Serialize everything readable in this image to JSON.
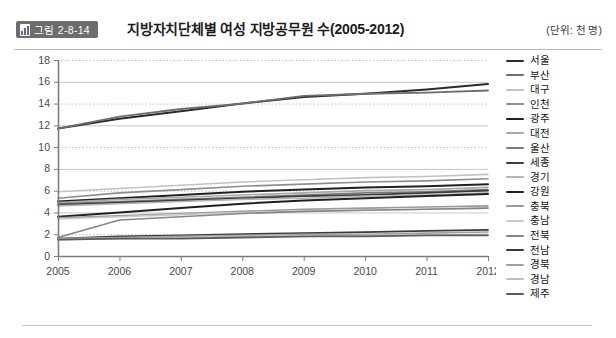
{
  "header": {
    "badge_label": "그림 2-8-14",
    "badge_icon": "bar-chart-icon",
    "title": "지방자치단체별 여성 지방공무원 수(2005-2012)",
    "unit_note": "(단위: 천 명)"
  },
  "colors": {
    "badge_bg": "#6d6d6d",
    "axis": "#7d7d7d",
    "grid_solid": "#c8c8c8",
    "grid_dotted": "#bdbdbd",
    "panel_bg": "#ffffff",
    "text": "#141414"
  },
  "chart_data": {
    "type": "line",
    "title": "지방자치단체별 여성 지방공무원 수(2005-2012)",
    "xlabel": "",
    "ylabel": "",
    "unit": "천 명",
    "grid": true,
    "legend_position": "right",
    "x": [
      "2005",
      "2006",
      "2007",
      "2008",
      "2009",
      "2010",
      "2011",
      "2012"
    ],
    "categories": [
      "2005",
      "2006",
      "2007",
      "2008",
      "2009",
      "2010",
      "2011",
      "2012"
    ],
    "ylim": [
      0,
      18
    ],
    "yticks": [
      0,
      2,
      4,
      6,
      8,
      10,
      12,
      14,
      16,
      18
    ],
    "series": [
      {
        "name": "서울",
        "color": "#2b2b2b",
        "width": 2.0,
        "values": [
          11.7,
          12.6,
          13.3,
          14.0,
          14.6,
          14.9,
          15.3,
          15.8
        ]
      },
      {
        "name": "부산",
        "color": "#6f6f6f",
        "width": 1.8,
        "values": [
          11.7,
          12.8,
          13.5,
          14.0,
          14.7,
          14.9,
          15.0,
          15.2
        ]
      },
      {
        "name": "대구",
        "color": "#c2c2c2",
        "width": 1.6,
        "values": [
          5.9,
          6.2,
          6.5,
          6.8,
          7.0,
          7.2,
          7.3,
          7.5
        ]
      },
      {
        "name": "인천",
        "color": "#8d8d8d",
        "width": 1.6,
        "values": [
          5.3,
          5.8,
          6.1,
          6.4,
          6.6,
          6.8,
          6.9,
          7.1
        ]
      },
      {
        "name": "광주",
        "color": "#1f1f1f",
        "width": 2.0,
        "values": [
          5.0,
          5.3,
          5.6,
          5.9,
          6.1,
          6.3,
          6.4,
          6.6
        ]
      },
      {
        "name": "대전",
        "color": "#a8a8a8",
        "width": 1.6,
        "values": [
          4.9,
          5.2,
          5.4,
          5.6,
          5.8,
          6.0,
          6.1,
          6.3
        ]
      },
      {
        "name": "울산",
        "color": "#7a7a7a",
        "width": 1.6,
        "values": [
          4.8,
          5.0,
          5.2,
          5.4,
          5.6,
          5.8,
          5.9,
          6.1
        ]
      },
      {
        "name": "세종",
        "color": "#3d3d3d",
        "width": 1.8,
        "values": [
          4.7,
          4.9,
          5.1,
          5.3,
          5.5,
          5.6,
          5.8,
          6.0
        ]
      },
      {
        "name": "경기",
        "color": "#b5b5b5",
        "width": 1.6,
        "values": [
          4.6,
          4.8,
          5.0,
          5.2,
          5.3,
          5.5,
          5.6,
          5.8
        ]
      },
      {
        "name": "강원",
        "color": "#202020",
        "width": 2.0,
        "values": [
          3.6,
          4.0,
          4.4,
          4.8,
          5.1,
          5.3,
          5.5,
          5.7
        ]
      },
      {
        "name": "충북",
        "color": "#9a9a9a",
        "width": 1.6,
        "values": [
          3.5,
          3.7,
          3.9,
          4.1,
          4.3,
          4.4,
          4.5,
          4.6
        ]
      },
      {
        "name": "충남",
        "color": "#cacaca",
        "width": 1.6,
        "values": [
          3.4,
          3.6,
          3.8,
          4.0,
          4.1,
          4.2,
          4.3,
          4.4
        ]
      },
      {
        "name": "전북",
        "color": "#868686",
        "width": 1.6,
        "values": [
          1.7,
          3.3,
          3.6,
          3.9,
          4.1,
          4.2,
          4.3,
          4.4
        ]
      },
      {
        "name": "전남",
        "color": "#3a3a3a",
        "width": 1.8,
        "values": [
          1.6,
          1.8,
          1.9,
          2.0,
          2.1,
          2.2,
          2.3,
          2.4
        ]
      },
      {
        "name": "경북",
        "color": "#a0a0a0",
        "width": 1.6,
        "values": [
          1.6,
          1.7,
          1.8,
          1.9,
          2.0,
          2.0,
          2.1,
          2.2
        ]
      },
      {
        "name": "경남",
        "color": "#bdbdbd",
        "width": 1.6,
        "values": [
          1.5,
          1.6,
          1.7,
          1.8,
          1.8,
          1.9,
          1.9,
          2.0
        ]
      },
      {
        "name": "제주",
        "color": "#5c5c5c",
        "width": 1.8,
        "values": [
          1.5,
          1.6,
          1.6,
          1.7,
          1.8,
          1.8,
          1.9,
          1.9
        ]
      }
    ]
  }
}
